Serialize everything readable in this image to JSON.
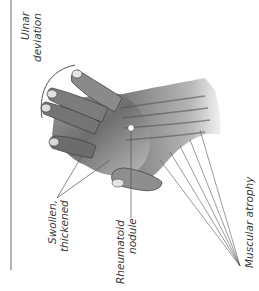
{
  "figure": {
    "rule_color": "#8a8a8a",
    "line_color": "#555555",
    "text_color": "#3a3a3a"
  },
  "labels": {
    "ulnar_deviation": {
      "line1": "Ulnar",
      "line2": "deviation"
    },
    "swollen_thickened": {
      "line1": "Swollen,",
      "line2": "thickened"
    },
    "rheumatoid_nodule": {
      "line1": "Rheumatoid",
      "line2": "nodule"
    },
    "muscular_atrophy": {
      "line1": "Muscular atrophy"
    }
  }
}
